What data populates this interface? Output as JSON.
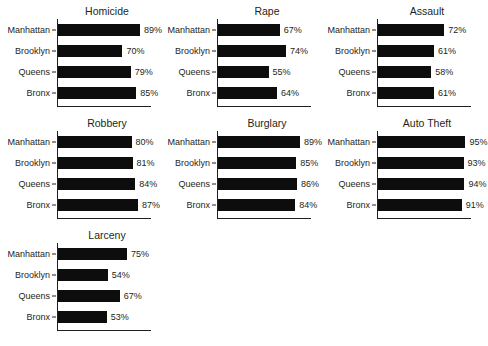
{
  "chart_data": {
    "type": "bar",
    "orientation": "horizontal",
    "title": "",
    "xlabel": "",
    "ylabel": "",
    "xlim": [
      0,
      100
    ],
    "grid": false,
    "legend": null,
    "value_suffix": "%",
    "categories": [
      "Manhattan",
      "Brooklyn",
      "Queens",
      "Bronx"
    ],
    "facets": [
      {
        "title": "Homicide",
        "values": [
          89,
          70,
          79,
          85
        ],
        "labels": [
          "89%",
          "70%",
          "79%",
          "85%"
        ]
      },
      {
        "title": "Rape",
        "values": [
          67,
          74,
          55,
          64
        ],
        "labels": [
          "67%",
          "74%",
          "55%",
          "64%"
        ]
      },
      {
        "title": "Assault",
        "values": [
          72,
          61,
          58,
          61
        ],
        "labels": [
          "72%",
          "61%",
          "58%",
          "61%"
        ]
      },
      {
        "title": "Robbery",
        "values": [
          80,
          81,
          84,
          87
        ],
        "labels": [
          "80%",
          "81%",
          "84%",
          "87%"
        ]
      },
      {
        "title": "Burglary",
        "values": [
          89,
          85,
          86,
          84
        ],
        "labels": [
          "89%",
          "85%",
          "86%",
          "84%"
        ]
      },
      {
        "title": "Auto Theft",
        "values": [
          95,
          93,
          94,
          91
        ],
        "labels": [
          "95%",
          "93%",
          "94%",
          "91%"
        ]
      },
      {
        "title": "Larceny",
        "values": [
          75,
          54,
          67,
          53
        ],
        "labels": [
          "75%",
          "54%",
          "67%",
          "53%"
        ]
      }
    ],
    "colors": {
      "bar": "#0d0d0d",
      "axis": "#231f20",
      "text": "#231f20",
      "background": "#ffffff"
    }
  }
}
